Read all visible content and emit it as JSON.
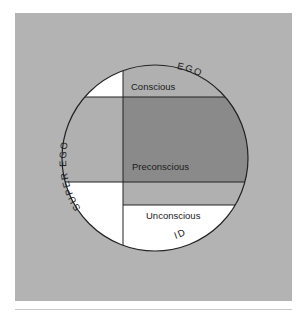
{
  "diagram": {
    "type": "freud-structure-of-mind",
    "colors": {
      "background_panel": "#b3b3b3",
      "ego_region": "#b0b0b0",
      "preconscious_dark": "#8a8a8a",
      "white_region": "#ffffff",
      "outline": "#222222"
    },
    "labels": {
      "ego": "EGO",
      "super_ego": "SUPER EGO",
      "id": "ID",
      "conscious": "Conscious",
      "preconscious": "Preconscious",
      "unconscious": "Unconscious"
    }
  }
}
